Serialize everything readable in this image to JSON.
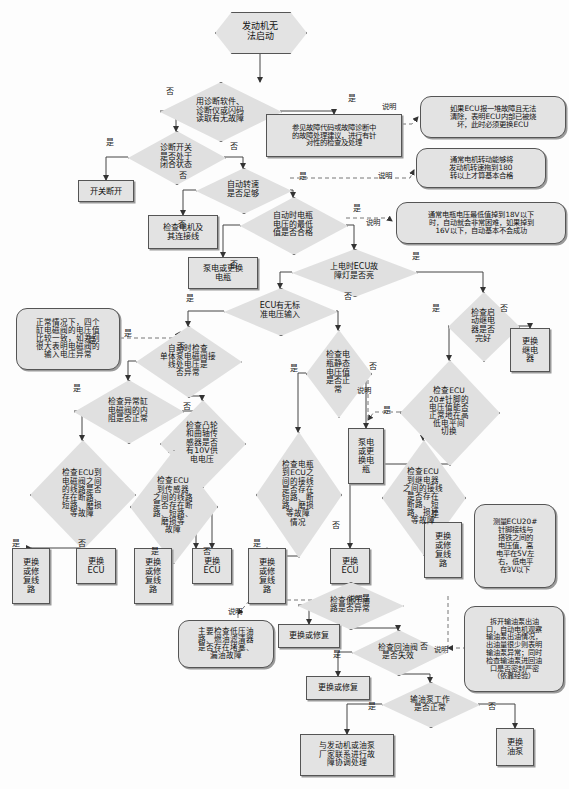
{
  "diagram": {
    "type": "flowchart",
    "colors": {
      "node_fill": "#e3e3e3",
      "diamond_fill": "#e0e0e0",
      "stroke": "#555555",
      "background": "#fdfdfd",
      "text": "#111111"
    }
  },
  "nodes": {
    "start": {
      "id": "start",
      "shape": "hexagon",
      "text": "发动机无\n法启动",
      "x": 215,
      "y": 12,
      "w": 90,
      "h": 40,
      "font": 9
    },
    "d_read_code": {
      "id": "d_read_code",
      "shape": "diamond",
      "text": "用诊断软件、\n诊断仪或闪码\n读取有无故障",
      "x": 160,
      "y": 82,
      "w": 120,
      "h": 58,
      "font": 8
    },
    "p_code_advice": {
      "id": "p_code_advice",
      "shape": "rect",
      "text": "参见故障代码或故障诊断中\n的故障处理建议，进行有针\n对性的检查及处理",
      "x": 266,
      "y": 114,
      "w": 136,
      "h": 43,
      "font": 7.4
    },
    "n_ecu_burn": {
      "id": "n_ecu_burn",
      "shape": "note",
      "text": "如果ECU报一堆故障且无法\n清除，表明ECU内部已被烧\n坏，此时必须更换ECU",
      "x": 420,
      "y": 96,
      "w": 146,
      "h": 42,
      "font": 7.4
    },
    "d_diag_switch": {
      "id": "d_diag_switch",
      "shape": "diamond",
      "text": "诊断开关\n是否处于\n闭合状态",
      "x": 128,
      "y": 131,
      "w": 96,
      "h": 52,
      "font": 8
    },
    "p_switch_open": {
      "id": "p_switch_open",
      "shape": "rect",
      "text": "开关断开",
      "x": 78,
      "y": 180,
      "w": 56,
      "h": 22,
      "font": 8.2
    },
    "d_crank_speed": {
      "id": "d_crank_speed",
      "shape": "diamond",
      "text": "自动转速\n是否足够",
      "x": 196,
      "y": 168,
      "w": 94,
      "h": 44,
      "font": 8
    },
    "n_crank_180": {
      "id": "n_crank_180",
      "shape": "note",
      "text": "通常电机转动能够将\n发动机转速拖到180\n转以上才算基本合格",
      "x": 416,
      "y": 148,
      "w": 130,
      "h": 40,
      "font": 7.4
    },
    "p_check_motor": {
      "id": "p_check_motor",
      "shape": "rect",
      "text": "检查电机及\n其连接线",
      "x": 148,
      "y": 215,
      "w": 70,
      "h": 34,
      "font": 8.2
    },
    "d_batt_min": {
      "id": "d_batt_min",
      "shape": "diamond",
      "text": "自动时电瓶\n电压的最低\n值是否合格",
      "x": 240,
      "y": 197,
      "w": 106,
      "h": 56,
      "font": 8
    },
    "n_batt_18v": {
      "id": "n_batt_18v",
      "shape": "note",
      "text": "通常电瓶电压最低值掉到18V以下\n时，自动就会非常困难，如果掉到\n16V以下，自动基本不会成功",
      "x": 396,
      "y": 202,
      "w": 170,
      "h": 42,
      "font": 7.2
    },
    "p_charge_batt1": {
      "id": "p_charge_batt1",
      "shape": "rect",
      "text": "泵电或更换\n电瓶",
      "x": 188,
      "y": 257,
      "w": 70,
      "h": 32,
      "font": 8.2
    },
    "d_ecu_lamp": {
      "id": "d_ecu_lamp",
      "shape": "diamond",
      "text": "上电时ECU故\n障灯是否亮",
      "x": 292,
      "y": 249,
      "w": 124,
      "h": 46,
      "font": 8
    },
    "d_ecu_volt": {
      "id": "d_ecu_volt",
      "shape": "diamond",
      "text": "ECU有无标\n准电压输入",
      "x": 224,
      "y": 288,
      "w": 112,
      "h": 46,
      "font": 8
    },
    "d_relay_ok": {
      "id": "d_relay_ok",
      "shape": "diamond",
      "text": "检查启\n动继电\n器是否\n完好",
      "x": 448,
      "y": 292,
      "w": 70,
      "h": 68,
      "font": 8
    },
    "p_replace_relay": {
      "id": "p_replace_relay",
      "shape": "rect",
      "text": "更换\n继电\n器",
      "x": 510,
      "y": 328,
      "w": 40,
      "h": 44,
      "font": 8.2
    },
    "n_solenoid_volt": {
      "id": "n_solenoid_volt",
      "shape": "note",
      "text": "正常情况下，四个\n缸电磁阀的电压值\n比较一致，如差别\n很大表明电磁阀的\n输入电压异常",
      "x": 16,
      "y": 308,
      "w": 104,
      "h": 62,
      "font": 7.6
    },
    "d_pump_solenoid": {
      "id": "d_pump_solenoid",
      "shape": "diamond",
      "text": "自动时检查\n单体泵电磁阀接\n线处电压是\n否异常",
      "x": 136,
      "y": 326,
      "w": 104,
      "h": 70,
      "font": 7.6
    },
    "d_batt_static": {
      "id": "d_batt_static",
      "shape": "diamond",
      "text": "检查电\n瓶静态\n电压值\n是否正\n常",
      "x": 306,
      "y": 330,
      "w": 64,
      "h": 86,
      "font": 8
    },
    "d_ecu20_pin": {
      "id": "d_ecu20_pin",
      "shape": "diamond",
      "text": "检查ECU\n20#针脚的\n电压值能否\n正常地在高\n低电平间\n切换",
      "x": 400,
      "y": 360,
      "w": 98,
      "h": 104,
      "font": 7.6
    },
    "d_solenoid_res": {
      "id": "d_solenoid_res",
      "shape": "diamond",
      "text": "检查异常缸\n电磁阀的内\n阻是否正常",
      "x": 74,
      "y": 380,
      "w": 108,
      "h": 62,
      "font": 7.8
    },
    "d_cam_sensor": {
      "id": "d_cam_sensor",
      "shape": "diamond",
      "text": "检查凸轮\n和曲轴传\n感器是否\n有10V供\n电电压",
      "x": 160,
      "y": 400,
      "w": 84,
      "h": 86,
      "font": 7.8
    },
    "p_charge_batt2": {
      "id": "p_charge_batt2",
      "shape": "rect",
      "text": "泵电\n或更\n换电\n瓶",
      "x": 348,
      "y": 428,
      "w": 36,
      "h": 56,
      "font": 8.2
    },
    "d_ecu_to_solenoid": {
      "id": "d_ecu_to_solenoid",
      "shape": "diamond",
      "text": "检查ECU到\n电磁阀之间\n的线路是否\n存在断路、\n短路、磨损\n等故障",
      "x": 30,
      "y": 440,
      "w": 104,
      "h": 108,
      "font": 7.6
    },
    "d_ecu_to_sensor": {
      "id": "d_ecu_to_sensor",
      "shape": "diamond",
      "text": "检查ECU\n到传感器\n之间的线路\n是否存在断\n路、短路、\n磨损等\n故障",
      "x": 130,
      "y": 450,
      "w": 86,
      "h": 112,
      "font": 7.6
    },
    "d_batt_to_ecu": {
      "id": "d_batt_to_ecu",
      "shape": "diamond",
      "text": "检查电瓶\n到ECU之\n间的接线\n是否存在\n短路、断\n路、磨损\n等故障\n情况",
      "x": 256,
      "y": 432,
      "w": 84,
      "h": 124,
      "font": 7.6
    },
    "d_ecu_to_relay": {
      "id": "d_ecu_to_relay",
      "shape": "diamond",
      "text": "检查ECU\n到继电器\n之间的接线\n是否存在\n断路、短\n路、损坏\n等故障",
      "x": 382,
      "y": 440,
      "w": 82,
      "h": 114,
      "font": 7.6
    },
    "p_fix_wire1": {
      "id": "p_fix_wire1",
      "shape": "rect",
      "text": "更换\n或修\n复线\n路",
      "x": 12,
      "y": 548,
      "w": 38,
      "h": 56,
      "font": 8.2
    },
    "p_replace_ecu1": {
      "id": "p_replace_ecu1",
      "shape": "rect",
      "text": "更换\nECU",
      "x": 76,
      "y": 548,
      "w": 40,
      "h": 36,
      "font": 8.2
    },
    "p_fix_wire2": {
      "id": "p_fix_wire2",
      "shape": "rect",
      "text": "更换\n或修\n复线\n路",
      "x": 134,
      "y": 548,
      "w": 38,
      "h": 56,
      "font": 8.2
    },
    "p_replace_ecu2": {
      "id": "p_replace_ecu2",
      "shape": "rect",
      "text": "更换\nECU",
      "x": 192,
      "y": 548,
      "w": 40,
      "h": 36,
      "font": 8.2
    },
    "p_fix_wire3": {
      "id": "p_fix_wire3",
      "shape": "rect",
      "text": "更换\n或修\n复线\n路",
      "x": 248,
      "y": 548,
      "w": 38,
      "h": 56,
      "font": 8.2
    },
    "p_replace_ecu3": {
      "id": "p_replace_ecu3",
      "shape": "rect",
      "text": "更换\nECU",
      "x": 330,
      "y": 548,
      "w": 40,
      "h": 36,
      "font": 8.2
    },
    "p_fix_wire4": {
      "id": "p_fix_wire4",
      "shape": "rect",
      "text": "更换\n或修\n复线\n路",
      "x": 424,
      "y": 522,
      "w": 38,
      "h": 56,
      "font": 8.2
    },
    "n_ecu20_measure": {
      "id": "n_ecu20_measure",
      "shape": "note",
      "text": "测量ECU20#\n针脚接线与\n搭铁之间的\n电压值，高\n电平在5V左\n右，低电平\n在3V以下",
      "x": 474,
      "y": 504,
      "w": 82,
      "h": 84,
      "font": 7.4
    },
    "n_low_press": {
      "id": "n_low_press",
      "shape": "note",
      "text": "主要检查低压油\n路、燃油滤清器\n是否存在堵塞、\n漏油故障",
      "x": 178,
      "y": 620,
      "w": 96,
      "h": 48,
      "font": 7.6
    },
    "d_low_press_line": {
      "id": "d_low_press_line",
      "shape": "diamond",
      "text": "检查低压油\n路是否异常",
      "x": 298,
      "y": 582,
      "w": 104,
      "h": 46,
      "font": 7.8
    },
    "p_fix_or_repl1": {
      "id": "p_fix_or_repl1",
      "shape": "rect",
      "text": "更换或修复",
      "x": 278,
      "y": 624,
      "w": 62,
      "h": 24,
      "font": 8
    },
    "d_return_valve": {
      "id": "d_return_valve",
      "shape": "diamond",
      "text": "检查回油阀\n是否失效",
      "x": 352,
      "y": 630,
      "w": 92,
      "h": 44,
      "font": 7.8
    },
    "p_fix_or_repl2": {
      "id": "p_fix_or_repl2",
      "shape": "rect",
      "text": "更换或修复",
      "x": 306,
      "y": 676,
      "w": 64,
      "h": 24,
      "font": 8
    },
    "n_fuel_pump_note": {
      "id": "n_fuel_pump_note",
      "shape": "note",
      "text": "拆开输油泵出油\n口，自动电机观察\n输油泵出油情况，\n出油量很少则表明\n输油泵异常；同时\n检查输油泵进回油\n口是否密封严密\n（依靠经验）",
      "x": 464,
      "y": 606,
      "w": 100,
      "h": 86,
      "font": 7.2
    },
    "d_fuel_pump_work": {
      "id": "d_fuel_pump_work",
      "shape": "diamond",
      "text": "输油泵工作\n是否正常",
      "x": 382,
      "y": 682,
      "w": 96,
      "h": 44,
      "font": 7.8
    },
    "p_replace_pump": {
      "id": "p_replace_pump",
      "shape": "rect",
      "text": "更换\n油泵",
      "x": 496,
      "y": 728,
      "w": 38,
      "h": 38,
      "font": 8.2
    },
    "p_contact_mfr": {
      "id": "p_contact_mfr",
      "shape": "rect",
      "text": "与发动机或油泵\n厂家联系进行故\n障协调处理",
      "x": 300,
      "y": 734,
      "w": 94,
      "h": 42,
      "font": 7.8
    }
  },
  "edge_labels": [
    {
      "text": "是",
      "x": 348,
      "y": 92
    },
    {
      "text": "否",
      "x": 166,
      "y": 85
    },
    {
      "text": "是",
      "x": 106,
      "y": 136
    },
    {
      "text": "否",
      "x": 230,
      "y": 140
    },
    {
      "text": "否",
      "x": 179,
      "y": 169
    },
    {
      "text": "是",
      "x": 299,
      "y": 170
    },
    {
      "text": "否",
      "x": 178,
      "y": 218
    },
    {
      "text": "是",
      "x": 353,
      "y": 202
    },
    {
      "text": "否",
      "x": 230,
      "y": 258
    },
    {
      "text": "是",
      "x": 412,
      "y": 250
    },
    {
      "text": "否",
      "x": 344,
      "y": 290
    },
    {
      "text": "是",
      "x": 186,
      "y": 292
    },
    {
      "text": "是",
      "x": 432,
      "y": 302
    },
    {
      "text": "否",
      "x": 500,
      "y": 302
    },
    {
      "text": "是",
      "x": 124,
      "y": 327
    },
    {
      "text": "是",
      "x": 88,
      "y": 334
    },
    {
      "text": "否",
      "x": 183,
      "y": 400
    },
    {
      "text": "是",
      "x": 290,
      "y": 362
    },
    {
      "text": "否",
      "x": 369,
      "y": 360
    },
    {
      "text": "是",
      "x": 73,
      "y": 382
    },
    {
      "text": "否",
      "x": 177,
      "y": 340
    },
    {
      "text": "是",
      "x": 383,
      "y": 404
    },
    {
      "text": "是",
      "x": 12,
      "y": 537
    },
    {
      "text": "否",
      "x": 78,
      "y": 537
    },
    {
      "text": "是",
      "x": 151,
      "y": 545
    },
    {
      "text": "否",
      "x": 203,
      "y": 545
    },
    {
      "text": "是",
      "x": 253,
      "y": 537
    },
    {
      "text": "否",
      "x": 332,
      "y": 519
    },
    {
      "text": "是",
      "x": 431,
      "y": 508
    },
    {
      "text": "说明",
      "x": 382,
      "y": 100
    },
    {
      "text": "说明",
      "x": 378,
      "y": 169
    },
    {
      "text": "说明",
      "x": 366,
      "y": 216
    },
    {
      "text": "说明",
      "x": 357,
      "y": 384
    },
    {
      "text": "说明",
      "x": 348,
      "y": 592
    },
    {
      "text": "说明",
      "x": 228,
      "y": 605
    },
    {
      "text": "说明",
      "x": 434,
      "y": 643
    },
    {
      "text": "是",
      "x": 362,
      "y": 592
    },
    {
      "text": "是",
      "x": 333,
      "y": 648
    },
    {
      "text": "否",
      "x": 420,
      "y": 640
    },
    {
      "text": "是",
      "x": 368,
      "y": 700
    },
    {
      "text": "否",
      "x": 488,
      "y": 700
    }
  ]
}
